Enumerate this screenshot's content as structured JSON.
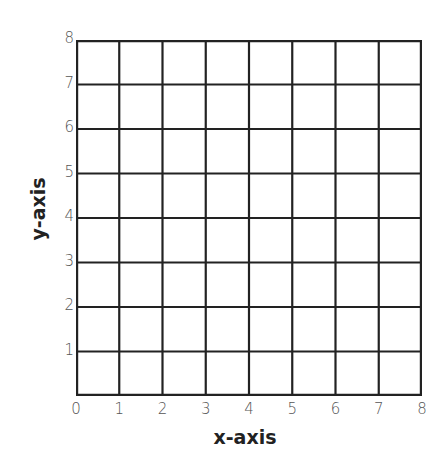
{
  "chart_data": {
    "type": "scatter",
    "title": "",
    "xlabel": "x-axis",
    "ylabel": "y-axis",
    "xlim": [
      0,
      8
    ],
    "ylim": [
      0,
      8
    ],
    "x_ticks": [
      "0",
      "1",
      "2",
      "3",
      "4",
      "5",
      "6",
      "7",
      "8"
    ],
    "y_ticks": [
      "1",
      "2",
      "3",
      "4",
      "5",
      "6",
      "7",
      "8"
    ],
    "grid": true,
    "series": [],
    "line_color": "#222222"
  },
  "axes": {
    "xlabel": "x-axis",
    "ylabel": "y-axis",
    "x_ticks": [
      "0",
      "1",
      "2",
      "3",
      "4",
      "5",
      "6",
      "7",
      "8"
    ],
    "y_ticks": [
      "1",
      "2",
      "3",
      "4",
      "5",
      "6",
      "7",
      "8"
    ]
  }
}
